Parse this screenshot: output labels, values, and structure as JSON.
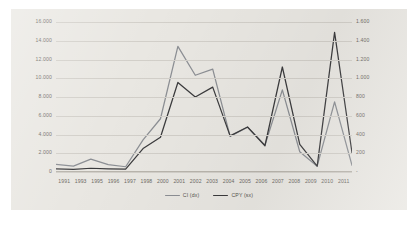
{
  "chart_data": {
    "type": "line",
    "title": "",
    "xlabel": "",
    "grid": true,
    "legend_position": "bottom",
    "categories": [
      "1991",
      "1993",
      "1995",
      "1996",
      "1997",
      "1998",
      "2000",
      "2001",
      "2002",
      "2003",
      "2004",
      "2005",
      "2006",
      "2007",
      "2008",
      "2009",
      "2010",
      "2011"
    ],
    "axes": {
      "left": {
        "label": "",
        "ylim": [
          0,
          16000
        ],
        "ticks": [
          "0",
          "2.000",
          "4.000",
          "6.000",
          "8.000",
          "10.000",
          "12.000",
          "14.000",
          "16.000"
        ],
        "tick_values": [
          0,
          2000,
          4000,
          6000,
          8000,
          10000,
          12000,
          14000,
          16000
        ]
      },
      "right": {
        "label": "",
        "ylim": [
          0,
          1600
        ],
        "ticks": [
          "-",
          "200",
          "400",
          "600",
          "800",
          "1.000",
          "1.200",
          "1.400",
          "1.600"
        ],
        "tick_values": [
          0,
          200,
          400,
          600,
          800,
          1000,
          1200,
          1400,
          1600
        ]
      }
    },
    "series": [
      {
        "name": "CI (dx)",
        "axis": "left",
        "color": "#8c8f94",
        "values": [
          820,
          620,
          1380,
          780,
          560,
          3420,
          5680,
          13400,
          10320,
          10980,
          3800,
          4780,
          2860,
          8760,
          2160,
          620,
          7480,
          720
        ]
      },
      {
        "name": "CPY (sx)",
        "axis": "right",
        "color": "#3b3b3d",
        "values": [
          34,
          28,
          40,
          34,
          30,
          250,
          370,
          955,
          800,
          905,
          385,
          480,
          280,
          1120,
          295,
          62,
          1490,
          205
        ]
      }
    ]
  },
  "legend": {
    "items": [
      {
        "label": "CI (dx)",
        "color": "#8c8f94"
      },
      {
        "label": "CPY (sx)",
        "color": "#3b3b3d"
      }
    ]
  }
}
